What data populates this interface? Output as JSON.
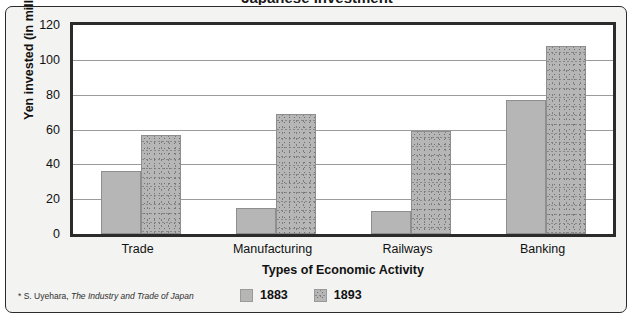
{
  "figure": {
    "cutoff_title": "Japanese Investment",
    "footnote_marker": "*",
    "footnote_author": "S. Uyehara,",
    "footnote_source_title": "The Industry and Trade of Japan"
  },
  "colors": {
    "bar_1883": "#b6b6b6",
    "bar_1893_base": "#b6b6b6",
    "bar_1893_speckle": "#6f6f6f",
    "frame": "#2b2b2b",
    "gridline": "#9b9b9b",
    "plot_background": "#ffffff",
    "card_background": "#f3f3f1",
    "text": "#111111"
  },
  "chart_data": {
    "type": "bar",
    "title": "",
    "xlabel": "Types of Economic Activity",
    "ylabel": "Yen invested (in millions)",
    "categories": [
      "Trade",
      "Manufacturing",
      "Railways",
      "Banking"
    ],
    "series": [
      {
        "name": "1883",
        "values": [
          36,
          15,
          13,
          77
        ]
      },
      {
        "name": "1893",
        "values": [
          57,
          69,
          59,
          108
        ]
      }
    ],
    "ylim": [
      0,
      120
    ],
    "yticks": [
      0,
      20,
      40,
      60,
      80,
      100,
      120
    ],
    "ytick_labels": [
      "0",
      "20",
      "40",
      "60",
      "80",
      "100",
      "120"
    ],
    "grid": true,
    "grid_axis": "y",
    "legend_position": "bottom-center",
    "legend_entries": [
      "1883",
      "1893"
    ]
  }
}
